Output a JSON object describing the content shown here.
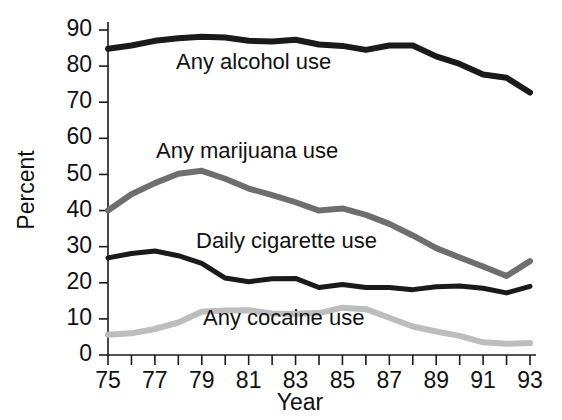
{
  "chart_data": {
    "type": "line",
    "title": "",
    "xlabel": "Year",
    "ylabel": "Percent",
    "xlim": [
      75,
      93
    ],
    "ylim": [
      0,
      90
    ],
    "ytick_step": 10,
    "grid": false,
    "legend_position": "inline-labels",
    "x": [
      75,
      76,
      77,
      78,
      79,
      80,
      81,
      82,
      83,
      84,
      85,
      86,
      87,
      88,
      89,
      90,
      91,
      92,
      93
    ],
    "xtick_labels": [
      "75",
      "77",
      "79",
      "81",
      "83",
      "85",
      "87",
      "89",
      "91",
      "93"
    ],
    "ytick_labels": [
      "0",
      "10",
      "20",
      "30",
      "40",
      "50",
      "60",
      "70",
      "80",
      "90"
    ],
    "series": [
      {
        "name": "Any alcohol use",
        "color": "#1a1a1a",
        "stroke_width": 6,
        "values": [
          84.8,
          85.7,
          87.0,
          87.7,
          88.1,
          87.9,
          87.0,
          86.8,
          87.3,
          86.0,
          85.6,
          84.5,
          85.7,
          85.7,
          82.7,
          80.6,
          77.7,
          76.8,
          72.7
        ]
      },
      {
        "name": "Any marijuana use",
        "color": "#6e6e6e",
        "stroke_width": 6,
        "values": [
          40.0,
          44.5,
          47.6,
          50.2,
          51.0,
          48.8,
          46.1,
          44.3,
          42.3,
          40.0,
          40.6,
          38.8,
          36.3,
          33.1,
          29.6,
          27.0,
          24.5,
          21.9,
          26.0
        ]
      },
      {
        "name": "Daily cigarette use",
        "color": "#1a1a1a",
        "stroke_width": 5,
        "values": [
          26.9,
          28.1,
          28.8,
          27.5,
          25.4,
          21.3,
          20.3,
          21.1,
          21.2,
          18.7,
          19.5,
          18.7,
          18.7,
          18.1,
          18.9,
          19.1,
          18.5,
          17.2,
          19.0
        ]
      },
      {
        "name": "Any cocaine use",
        "color": "#bdbdbd",
        "stroke_width": 6,
        "values": [
          5.6,
          6.0,
          7.2,
          9.0,
          12.0,
          12.3,
          12.4,
          11.5,
          11.4,
          11.6,
          13.1,
          12.7,
          10.3,
          7.9,
          6.5,
          5.3,
          3.5,
          3.1,
          3.3
        ]
      }
    ],
    "annotations": [
      {
        "text": "Any alcohol use",
        "x_px": 176,
        "y_px": 69
      },
      {
        "text": "Any marijuana use",
        "x_px": 156,
        "y_px": 158
      },
      {
        "text": "Daily cigarette use",
        "x_px": 196,
        "y_px": 248
      },
      {
        "text": "Any cocaine use",
        "x_px": 203,
        "y_px": 325
      }
    ]
  }
}
